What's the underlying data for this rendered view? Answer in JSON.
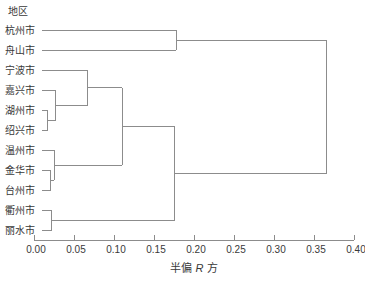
{
  "chart_data": {
    "type": "dendrogram",
    "orientation": "horizontal",
    "leaf_axis_title": "地区",
    "value_axis_title": "半偏 R 方",
    "value_axis_title_parts": {
      "prefix": "半偏 ",
      "italic": "R",
      "suffix": " 方"
    },
    "axis_range": [
      0.0,
      0.4
    ],
    "axis_ticks": [
      "0.00",
      "0.05",
      "0.10",
      "0.15",
      "0.20",
      "0.25",
      "0.30",
      "0.35",
      "0.40"
    ],
    "grid": false,
    "leaves": [
      "杭州市",
      "舟山市",
      "宁波市",
      "嘉兴市",
      "湖州市",
      "绍兴市",
      "温州市",
      "金华市",
      "台州市",
      "衢州市",
      "丽水市"
    ],
    "merges": [
      {
        "members": [
          "湖州市",
          "绍兴市"
        ],
        "height": 0.017
      },
      {
        "members": [
          "金华市",
          "台州市"
        ],
        "height": 0.021
      },
      {
        "members": [
          "衢州市",
          "丽水市"
        ],
        "height": 0.022
      },
      {
        "members": [
          "温州市",
          "金华市+台州市"
        ],
        "height": 0.025
      },
      {
        "members": [
          "嘉兴市",
          "湖州市+绍兴市"
        ],
        "height": 0.027
      },
      {
        "members": [
          "宁波市",
          "嘉兴市+湖州市+绍兴市"
        ],
        "height": 0.067
      },
      {
        "members": [
          "宁波嘉兴湖州绍兴",
          "温州金华台州"
        ],
        "height": 0.11
      },
      {
        "members": [
          "七市组",
          "衢州市+丽水市"
        ],
        "height": 0.176
      },
      {
        "members": [
          "杭州市",
          "舟山市"
        ],
        "height": 0.178
      },
      {
        "members": [
          "杭州舟山",
          "其余九市"
        ],
        "height": 0.366
      }
    ],
    "tree": {
      "height": 0.366,
      "children": [
        {
          "height": 0.178,
          "children": [
            {
              "leaf": "杭州市"
            },
            {
              "leaf": "舟山市"
            }
          ]
        },
        {
          "height": 0.176,
          "children": [
            {
              "height": 0.11,
              "children": [
                {
                  "height": 0.067,
                  "children": [
                    {
                      "leaf": "宁波市"
                    },
                    {
                      "height": 0.027,
                      "children": [
                        {
                          "leaf": "嘉兴市"
                        },
                        {
                          "height": 0.017,
                          "children": [
                            {
                              "leaf": "湖州市"
                            },
                            {
                              "leaf": "绍兴市"
                            }
                          ]
                        }
                      ]
                    }
                  ]
                },
                {
                  "height": 0.025,
                  "children": [
                    {
                      "leaf": "温州市"
                    },
                    {
                      "height": 0.021,
                      "children": [
                        {
                          "leaf": "金华市"
                        },
                        {
                          "leaf": "台州市"
                        }
                      ]
                    }
                  ]
                }
              ]
            },
            {
              "height": 0.022,
              "children": [
                {
                  "leaf": "衢州市"
                },
                {
                  "leaf": "丽水市"
                }
              ]
            }
          ]
        }
      ]
    },
    "colors": {
      "line": "#8c8c8c",
      "axis": "#8c8c8c",
      "text": "#3a3a3a"
    }
  }
}
